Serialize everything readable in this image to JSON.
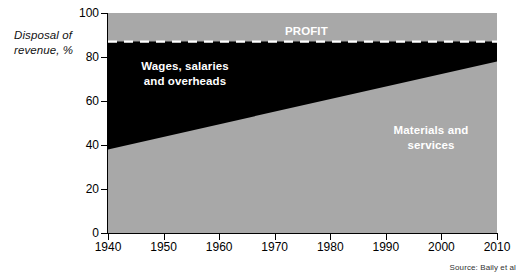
{
  "axis_title": "Disposal of\nrevenue, %",
  "source": "Source: Baily et al",
  "labels": {
    "wages": "Wages, salaries\nand overheads",
    "materials": "Materials and\nservices",
    "profit": "PROFIT"
  },
  "colors": {
    "materials_band": "#a8a8a8",
    "wages_band": "#000000",
    "profit_band": "#a8a8a8",
    "divider_dash": "#ffffff",
    "axis": "#000000",
    "label_text": "#ffffff"
  },
  "chart_data": {
    "type": "area",
    "title": "",
    "xlabel": "",
    "ylabel": "Disposal of revenue, %",
    "xlim": [
      1940,
      2010
    ],
    "ylim": [
      0,
      100
    ],
    "grid": false,
    "legend": "in-plot labels",
    "x_ticks": [
      1940,
      1950,
      1960,
      1970,
      1980,
      1990,
      2000,
      2010
    ],
    "y_ticks": [
      0,
      20,
      40,
      60,
      80,
      100
    ],
    "x": [
      1940,
      2010
    ],
    "series": [
      {
        "name": "Materials and services",
        "values": [
          38,
          78
        ],
        "color": "#a8a8a8",
        "stack_from": 0
      },
      {
        "name": "Wages, salaries and overheads",
        "values": [
          49,
          9
        ],
        "color": "#000000",
        "stack_from": 38
      },
      {
        "name": "PROFIT",
        "values": [
          13,
          13
        ],
        "color": "#a8a8a8",
        "stack_from": 87
      }
    ],
    "boundaries": {
      "materials_top": [
        38,
        78
      ],
      "profit_bottom": [
        87,
        87
      ]
    },
    "annotations": [
      {
        "text": "PROFIT",
        "x": 1992,
        "y": 93
      },
      {
        "text": "Wages, salaries and overheads",
        "x": 1973,
        "y": 75
      },
      {
        "text": "Materials and services",
        "x": 1995,
        "y": 42
      }
    ]
  }
}
